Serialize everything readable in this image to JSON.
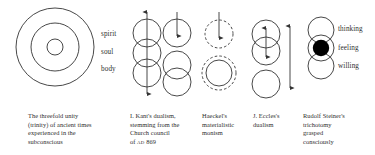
{
  "figure": {
    "title_alt": "Threefold unity and dualism diagrams",
    "stroke_color": "#333333",
    "fill_color": "#000000",
    "background": "#ffffff"
  },
  "left_labels": [
    {
      "text": "spirit"
    },
    {
      "text": "soul"
    },
    {
      "text": "body"
    }
  ],
  "right_labels": [
    {
      "text": "thinking"
    },
    {
      "text": "feeling"
    },
    {
      "text": "willing"
    }
  ],
  "captions": [
    {
      "id": "threefold-unity",
      "lines": [
        "The threefold unity",
        "(trinity) of ancient times",
        "experienced in the",
        "subconscious"
      ]
    },
    {
      "id": "kant-dualism",
      "lines": [
        "I. Kant's dualism,",
        "stemming from the",
        "Church council",
        "of AD 869"
      ],
      "smallcaps_token": "AD",
      "last_line_prefix": "of ",
      "last_line_suffix": " 869"
    },
    {
      "id": "haeckel-monism",
      "lines": [
        "Haeckel's",
        "materialistic",
        "monism"
      ]
    },
    {
      "id": "eccles-dualism",
      "lines": [
        "J. Eccles's",
        "dualism"
      ]
    },
    {
      "id": "steiner-trichotomy",
      "lines": [
        "Rudolf Steiner's",
        "trichotomy",
        "grasped",
        "consciously"
      ]
    }
  ]
}
